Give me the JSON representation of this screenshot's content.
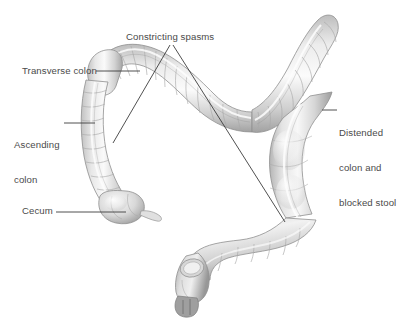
{
  "figure": {
    "background_color": "#ffffff",
    "label_color": "#4a4a4a",
    "leader_line_color": "#3c3c3c",
    "organ_fill_light": "#f2f2f2",
    "organ_fill_mid": "#cfcfcf",
    "organ_fill_dark": "#9a9a9a",
    "organ_outline": "#8d8d8d"
  },
  "labels": {
    "constricting_spasms": "Constricting spasms",
    "transverse_colon": "Transverse colon",
    "ascending_colon_line1": "Ascending",
    "ascending_colon_line2": "colon",
    "cecum": "Cecum",
    "distended_line1": "Distended",
    "distended_line2": "colon and",
    "distended_line3": "blocked stool"
  },
  "anatomy_parts": [
    "transverse-colon",
    "ascending-colon",
    "cecum",
    "appendix",
    "hepatic-flexure",
    "splenic-flexure",
    "descending-colon",
    "sigmoid-colon",
    "rectum",
    "anal-canal"
  ]
}
